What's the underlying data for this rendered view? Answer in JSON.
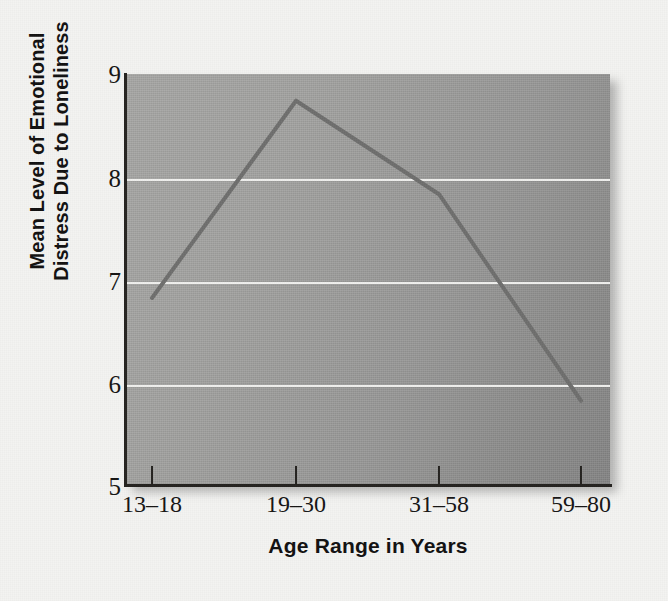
{
  "chart_data": {
    "type": "line",
    "title": "",
    "xlabel": "Age Range in Years",
    "ylabel_line1": "Mean Level of Emotional",
    "ylabel_line2": "Distress Due to Loneliness",
    "categories": [
      "13–18",
      "19–30",
      "31–58",
      "59–80"
    ],
    "values": [
      6.82,
      8.74,
      7.83,
      5.82
    ],
    "series": [
      {
        "name": "Mean Level of Emotional Distress Due to Loneliness",
        "values": [
          6.82,
          8.74,
          7.83,
          5.82
        ]
      }
    ],
    "ylim": [
      5,
      9
    ],
    "yticks": [
      5,
      6,
      7,
      8,
      9
    ],
    "ytick_labels": [
      "5",
      "6",
      "7",
      "8",
      "9"
    ],
    "xtick_labels": [
      "13–18",
      "19–30",
      "31–58",
      "59–80"
    ],
    "grid": true,
    "gridlines_at": [
      6,
      7,
      8
    ],
    "legend": "none",
    "line_color": "#6e6e6d",
    "gridline_color": "#f0f0ee",
    "plot_bg_color": "#9e9e9c",
    "axis_color": "#24221f",
    "page_bg_color": "#f3f3f1"
  },
  "axes": {
    "y_ticks": [
      {
        "label": "9",
        "value": 9
      },
      {
        "label": "8",
        "value": 8
      },
      {
        "label": "7",
        "value": 7
      },
      {
        "label": "6",
        "value": 6
      },
      {
        "label": "5",
        "value": 5
      }
    ],
    "x_ticks": [
      {
        "label": "13–18"
      },
      {
        "label": "19–30"
      },
      {
        "label": "31–58"
      },
      {
        "label": "59–80"
      }
    ]
  },
  "titles": {
    "x_axis": "Age Range in Years",
    "y_axis_line_1": "Mean Level of Emotional",
    "y_axis_line_2": "Distress Due to Loneliness"
  }
}
